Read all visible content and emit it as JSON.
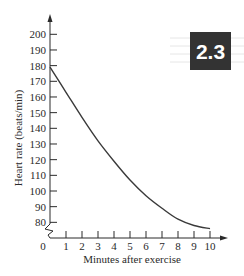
{
  "badge": {
    "label": "2.3",
    "background": "#333333",
    "text_color": "#ffffff"
  },
  "chart_data": {
    "type": "line",
    "title": "",
    "xlabel": "Minutes after exercise",
    "ylabel": "Heart rate (beats/min)",
    "x_ticks": [
      0,
      1,
      2,
      3,
      4,
      5,
      6,
      7,
      8,
      9,
      10
    ],
    "y_ticks": [
      80,
      90,
      100,
      110,
      120,
      130,
      140,
      150,
      160,
      170,
      180,
      190,
      200
    ],
    "xlim": [
      0,
      10
    ],
    "ylim": [
      70,
      205
    ],
    "y_axis_break": true,
    "grid": false,
    "legend": null,
    "series": [
      {
        "name": "Heart rate",
        "x": [
          0,
          1,
          2,
          3,
          4,
          5,
          6,
          7,
          8,
          9,
          10
        ],
        "y": [
          179,
          163,
          147,
          132,
          119,
          107,
          97,
          89,
          82,
          78,
          76
        ],
        "color": "#3a3a3a"
      }
    ]
  }
}
